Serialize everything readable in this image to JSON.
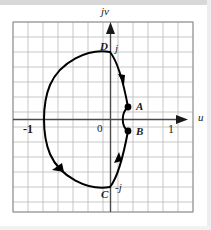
{
  "figure": {
    "axes": {
      "vertical_label": "jv",
      "horizontal_label": "u",
      "origin_label": "0",
      "ticks": {
        "left_real": "-1",
        "right_real": "1",
        "top_imag": "j",
        "bottom_imag": "-j"
      }
    },
    "points": [
      {
        "name": "A",
        "label": "A",
        "u": 0.25,
        "v": 0.3
      },
      {
        "name": "B",
        "label": "B",
        "u": 0.25,
        "v": -0.3
      },
      {
        "name": "C",
        "label": "C",
        "u": 0.0,
        "v": -1.0
      },
      {
        "name": "D",
        "label": "D",
        "u": 0.0,
        "v": 1.0
      }
    ],
    "colors": {
      "grid": "#b9b9b9",
      "axis": "#4a4a4a",
      "curve": "#000000",
      "border": "#8c8c8c",
      "background": "#ffffff",
      "text": "#1a1a1a"
    },
    "grid": {
      "visible": true,
      "cell_px": 15,
      "columns": 12,
      "rows": 13
    },
    "contour": {
      "type": "closed-path",
      "direction": "clockwise-through-right-then-counterclockwise-large-arc",
      "arrow_count": 3,
      "segments": [
        {
          "from": "D",
          "to": "A",
          "shape": "concave-arc"
        },
        {
          "from": "A",
          "to": "B",
          "shape": "small-arc-left-bulge"
        },
        {
          "from": "B",
          "to": "C",
          "shape": "concave-arc"
        },
        {
          "from": "C",
          "to": "D",
          "shape": "large-semicircle-through-minus-one"
        }
      ]
    }
  }
}
